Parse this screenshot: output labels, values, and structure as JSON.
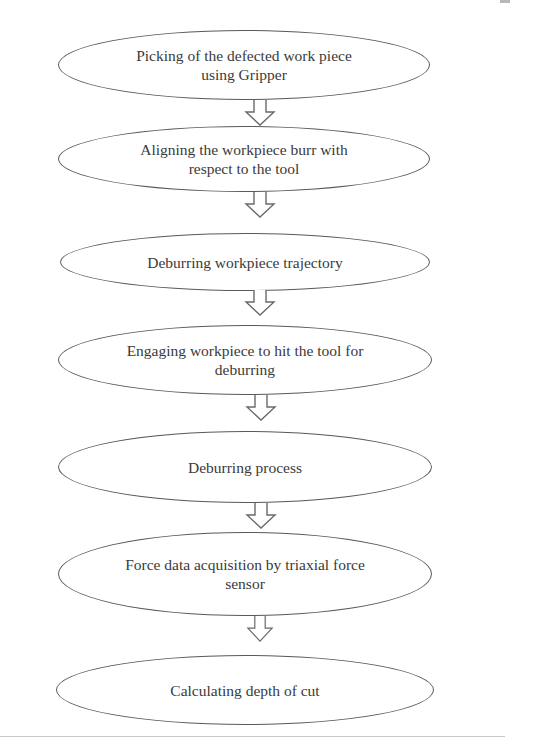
{
  "flowchart": {
    "steps": [
      {
        "label": "Picking of the defected work piece using Gripper",
        "lines": [
          "Picking of the defected work piece",
          "using Gripper"
        ]
      },
      {
        "label": "Aligning the workpiece burr with respect to the tool",
        "lines": [
          "Aligning the workpiece burr with",
          "respect to the tool"
        ]
      },
      {
        "label": "Deburring workpiece trajectory",
        "lines": [
          "Deburring workpiece trajectory"
        ]
      },
      {
        "label": "Engaging workpiece to hit the tool for deburring",
        "lines": [
          "Engaging workpiece to hit the tool for",
          "deburring"
        ]
      },
      {
        "label": "Deburring process",
        "lines": [
          "Deburring process"
        ]
      },
      {
        "label": "Force data acquisition by triaxial force sensor",
        "lines": [
          "Force data acquisition by triaxial force",
          "sensor"
        ]
      },
      {
        "label": "Calculating depth of cut",
        "lines": [
          "Calculating depth of cut"
        ]
      }
    ],
    "connector": "down-arrow",
    "colors": {
      "stroke": "#5a5a5a",
      "text": "#3a3a3a",
      "background": "#ffffff"
    }
  }
}
